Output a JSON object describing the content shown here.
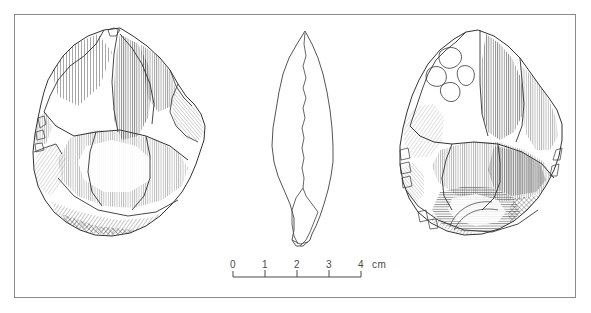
{
  "figure": {
    "type": "archaeological-line-drawing",
    "caption": "",
    "frame_color": "#8a8a8a",
    "ink_color": "#333333",
    "background_color": "#ffffff"
  },
  "views": [
    {
      "name": "dorsal-face",
      "label": "",
      "position": "left",
      "bbox": [
        33,
        27,
        172,
        208
      ]
    },
    {
      "name": "profile-section",
      "label": "",
      "position": "center",
      "bbox": [
        272,
        30,
        62,
        215
      ]
    },
    {
      "name": "ventral-face",
      "label": "",
      "position": "right",
      "bbox": [
        400,
        30,
        162,
        205
      ]
    }
  ],
  "scale_bar": {
    "name": "scale-bar",
    "unit_label": "cm",
    "ticks": [
      "0",
      "1",
      "2",
      "3",
      "4"
    ],
    "tick_values": [
      0,
      1,
      2,
      3,
      4
    ],
    "bar_left_px": 233,
    "bar_right_px": 361,
    "bar_y_px": 277,
    "px_per_unit": 32,
    "color": "#4a4a4a"
  }
}
